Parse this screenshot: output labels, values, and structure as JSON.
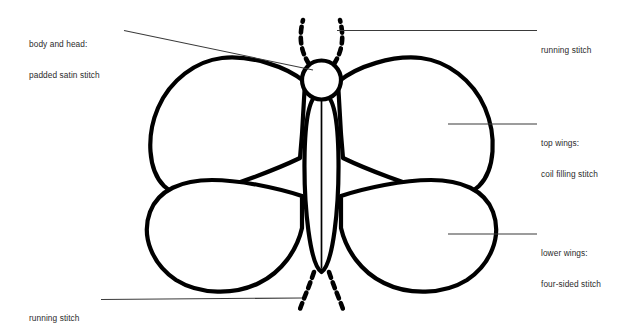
{
  "diagram": {
    "background_color": "#ffffff",
    "ink_color": "#000000",
    "label_color": "#2b2b2b",
    "leader_color": "#3a3a3a",
    "labels": [
      {
        "id": "body-head",
        "line1": "body and head:",
        "line2": "padded satin stitch",
        "anchor": "top-left",
        "target": "body-and-head"
      },
      {
        "id": "running-stitch-top",
        "line1": "running stitch",
        "line2": "",
        "anchor": "top-right",
        "target": "antennae"
      },
      {
        "id": "top-wings",
        "line1": "top wings:",
        "line2": "coil filling stitch",
        "anchor": "middle-right",
        "target": "upper-wing-right"
      },
      {
        "id": "lower-wings",
        "line1": "lower wings:",
        "line2": "four-sided stitch",
        "anchor": "lower-right",
        "target": "lower-wing-right"
      },
      {
        "id": "running-stitch-bottom",
        "line1": "running stitch",
        "line2": "",
        "anchor": "bottom-left",
        "target": "tails"
      }
    ],
    "parts": [
      {
        "name": "head",
        "shape": "circle"
      },
      {
        "name": "body",
        "shape": "elongated-oval"
      },
      {
        "name": "antenna-left",
        "shape": "dashed-curve"
      },
      {
        "name": "antenna-right",
        "shape": "dashed-curve"
      },
      {
        "name": "upper-wing-left",
        "shape": "wing"
      },
      {
        "name": "upper-wing-right",
        "shape": "wing"
      },
      {
        "name": "lower-wing-left",
        "shape": "wing"
      },
      {
        "name": "lower-wing-right",
        "shape": "wing"
      },
      {
        "name": "tail-left",
        "shape": "dashed-curve"
      },
      {
        "name": "tail-right",
        "shape": "dashed-curve"
      }
    ]
  }
}
